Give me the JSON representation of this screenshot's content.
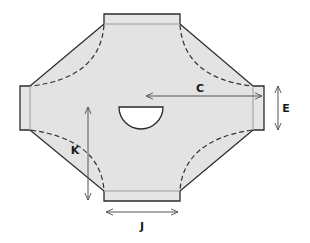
{
  "diagram": {
    "type": "flat-pattern",
    "colors": {
      "fill": "#e3e3e3",
      "tab_fill": "#e6e6e6",
      "outline": "#2b2b2b",
      "fold_line": "#9a9a9a",
      "dashed": "#333333",
      "dimension": "#555555",
      "cutout": "#ffffff",
      "background": "#ffffff"
    },
    "dimensions": [
      {
        "id": "C",
        "label": "C",
        "orientation": "horizontal",
        "description": "center to right edge"
      },
      {
        "id": "E",
        "label": "E",
        "orientation": "vertical",
        "description": "right tab height"
      },
      {
        "id": "K",
        "label": "K",
        "orientation": "vertical",
        "description": "center to bottom edge"
      },
      {
        "id": "J",
        "label": "J",
        "orientation": "horizontal",
        "description": "bottom tab width"
      }
    ],
    "tabs": [
      "top",
      "right",
      "bottom",
      "left"
    ],
    "cutout": "semicircle"
  }
}
